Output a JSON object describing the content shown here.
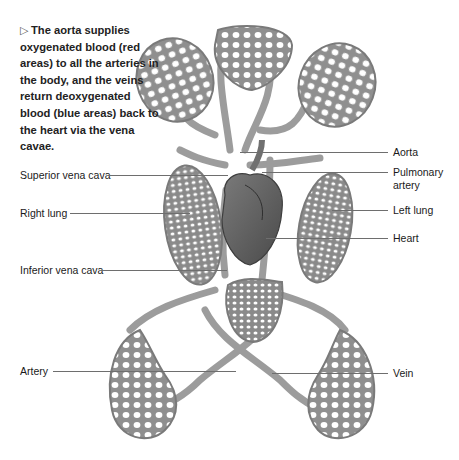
{
  "caption": {
    "marker": "▷",
    "text": "The aorta supplies oxygenated blood (red areas) to all the arteries in the body, and the veins return deoxygenated blood (blue areas) back to the heart via the vena cavae."
  },
  "labels": {
    "left": [
      {
        "id": "superior-vena-cava",
        "text": "Superior vena cava"
      },
      {
        "id": "right-lung",
        "text": "Right lung"
      },
      {
        "id": "inferior-vena-cava",
        "text": "Inferior vena cava"
      },
      {
        "id": "artery",
        "text": "Artery"
      }
    ],
    "right": [
      {
        "id": "aorta",
        "text": "Aorta"
      },
      {
        "id": "pulmonary-artery",
        "line1": "Pulmonary",
        "line2": "artery"
      },
      {
        "id": "left-lung",
        "text": "Left lung"
      },
      {
        "id": "heart",
        "text": "Heart"
      },
      {
        "id": "vein",
        "text": "Vein"
      }
    ]
  },
  "colors": {
    "vessel": "#9a9a9a",
    "vessel_dark": "#6f6f6f",
    "capillary_bed": "#8e8e8e",
    "heart": "#5e5e5e",
    "leader_line": "#6e6e6e"
  }
}
